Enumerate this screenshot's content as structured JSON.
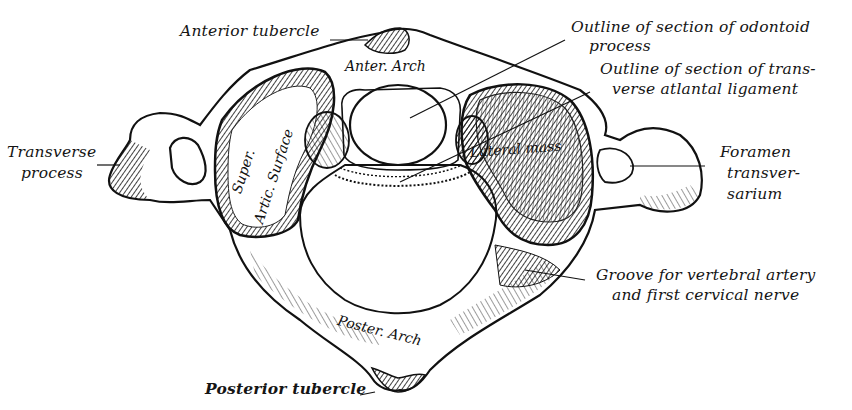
{
  "figure": {
    "colors": {
      "ink": "#111111",
      "paper": "#ffffff"
    }
  },
  "labels": {
    "anterior_tubercle": "Anterior tubercle",
    "odontoid_line1": "Outline of section of odontoid",
    "odontoid_line2": "process",
    "ligament_line1": "Outline of section of trans-",
    "ligament_line2": "verse atlantal ligament",
    "transverse_line1": "Transverse",
    "transverse_line2": "process",
    "foramen_line1": "Foramen",
    "foramen_line2": "transver-",
    "foramen_line3": "sarium",
    "groove_line1": "Groove for vertebral artery",
    "groove_line2": "and first cervical nerve",
    "posterior_tubercle": "Posterior tubercle"
  },
  "inline_labels": {
    "anter_arch": "Anter. Arch",
    "super_artic_1": "Super.",
    "super_artic_2": "Artic. Surface",
    "lateral_mass": "Lateral mass",
    "poster_arch": "Poster. Arch"
  }
}
